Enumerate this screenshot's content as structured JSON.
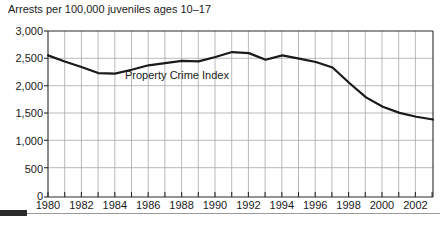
{
  "chart_data": {
    "type": "line",
    "title": "Arrests per 100,000 juveniles ages 10–17",
    "xlabel": "",
    "ylabel": "",
    "xlim": [
      1980,
      2003
    ],
    "ylim": [
      0,
      3000
    ],
    "grid": true,
    "legend_position": "inline-annotation",
    "annotations": [
      {
        "text": "Property Crime Index",
        "x": 1988.6,
        "y": 2150
      }
    ],
    "y_ticks": [
      0,
      500,
      1000,
      1500,
      2000,
      2500,
      3000
    ],
    "y_tick_labels": [
      "0",
      "500",
      "1,000",
      "1,500",
      "2,000",
      "2,500",
      "3,000"
    ],
    "x_ticks": [
      1980,
      1981,
      1982,
      1983,
      1984,
      1985,
      1986,
      1987,
      1988,
      1989,
      1990,
      1991,
      1992,
      1993,
      1994,
      1995,
      1996,
      1997,
      1998,
      1999,
      2000,
      2001,
      2002,
      2003
    ],
    "x_tick_labels": [
      "1980",
      "",
      "1982",
      "",
      "1984",
      "",
      "1986",
      "",
      "1988",
      "",
      "1990",
      "",
      "1992",
      "",
      "1994",
      "",
      "1996",
      "",
      "1998",
      "",
      "2000",
      "",
      "2002",
      ""
    ],
    "series": [
      {
        "name": "Property Crime Index",
        "color": "#1a1a1a",
        "x": [
          1980,
          1981,
          1982,
          1983,
          1984,
          1985,
          1986,
          1987,
          1988,
          1989,
          1990,
          1991,
          1992,
          1993,
          1994,
          1995,
          1996,
          1997,
          1998,
          1999,
          2000,
          2001,
          2002,
          2003
        ],
        "values": [
          2560,
          2450,
          2350,
          2240,
          2230,
          2300,
          2380,
          2420,
          2460,
          2450,
          2530,
          2620,
          2600,
          2480,
          2560,
          2500,
          2440,
          2340,
          2060,
          1800,
          1630,
          1520,
          1450,
          1400
        ]
      }
    ]
  },
  "footer": {
    "rule_label": "section-divider"
  }
}
